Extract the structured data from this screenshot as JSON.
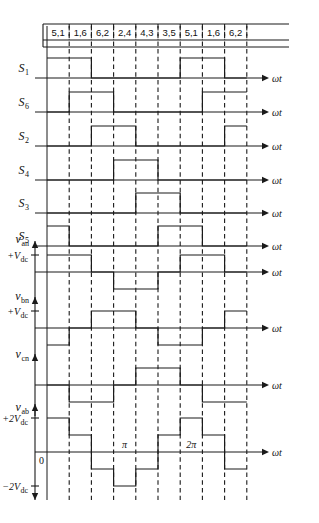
{
  "figure": {
    "axis_label": "ωt",
    "phase_marks": [
      {
        "label": "0",
        "x_col": 0
      },
      {
        "label": "π",
        "x_col": 3
      },
      {
        "label": "2π",
        "x_col": 6
      }
    ],
    "segment_headers": [
      "5,1",
      "1,6",
      "6,2",
      "2,4",
      "4,3",
      "3,5",
      "5,1",
      "1,6",
      "6,2"
    ],
    "segment_count": 9,
    "stroke_color": "#1a1a1a",
    "background_color": "#ffffff"
  },
  "chart_data": {
    "type": "line",
    "xlabel": "ωt",
    "ylabel": "",
    "grid": true,
    "legend": "none",
    "x_categories": [
      "5,1",
      "1,6",
      "6,2",
      "2,4",
      "4,3",
      "3,5",
      "5,1",
      "1,6",
      "6,2"
    ],
    "x_annotations": [
      {
        "label": "0",
        "segment_boundary": 0
      },
      {
        "label": "π",
        "segment_boundary": 3
      },
      {
        "label": "2π",
        "segment_boundary": 6
      }
    ],
    "note": "Each trace is a piecewise-constant waveform sampled over 9 equal 60-degree segments. Values are given per segment index 0..8.",
    "series": [
      {
        "name": "S1",
        "kind": "gate-signal",
        "label": "S",
        "subscript": "1",
        "levels": [
          1,
          1,
          0,
          0,
          0,
          0,
          1,
          1,
          0
        ],
        "ylim": [
          0,
          1
        ],
        "level_labels": []
      },
      {
        "name": "S6",
        "kind": "gate-signal",
        "label": "S",
        "subscript": "6",
        "levels": [
          0,
          1,
          1,
          0,
          0,
          0,
          0,
          1,
          1
        ],
        "ylim": [
          0,
          1
        ],
        "level_labels": []
      },
      {
        "name": "S2",
        "kind": "gate-signal",
        "label": "S",
        "subscript": "2",
        "levels": [
          0,
          0,
          1,
          1,
          0,
          0,
          0,
          0,
          1
        ],
        "ylim": [
          0,
          1
        ],
        "level_labels": []
      },
      {
        "name": "S4",
        "kind": "gate-signal",
        "label": "S",
        "subscript": "4",
        "levels": [
          0,
          0,
          0,
          1,
          1,
          0,
          0,
          0,
          0
        ],
        "ylim": [
          0,
          1
        ],
        "level_labels": []
      },
      {
        "name": "S3",
        "kind": "gate-signal",
        "label": "S",
        "subscript": "3",
        "levels": [
          0,
          0,
          0,
          0,
          1,
          1,
          0,
          0,
          0
        ],
        "ylim": [
          0,
          1
        ],
        "level_labels": []
      },
      {
        "name": "S5",
        "kind": "gate-signal",
        "label": "S",
        "subscript": "5",
        "levels": [
          1,
          0,
          0,
          0,
          0,
          1,
          1,
          0,
          0
        ],
        "ylim": [
          0,
          1
        ],
        "level_labels": []
      },
      {
        "name": "van",
        "kind": "phase-voltage",
        "label": "v",
        "subscript": "an",
        "levels": [
          1,
          1,
          0,
          -1,
          -1,
          0,
          1,
          1,
          0
        ],
        "ylim": [
          -1,
          1
        ],
        "level_labels": [
          {
            "text": "+V",
            "subscript": "dc",
            "value": 1
          }
        ]
      },
      {
        "name": "vbn",
        "kind": "phase-voltage",
        "label": "v",
        "subscript": "bn",
        "levels": [
          -1,
          0,
          1,
          1,
          0,
          -1,
          -1,
          0,
          1
        ],
        "ylim": [
          -1,
          1
        ],
        "level_labels": [
          {
            "text": "+V",
            "subscript": "dc",
            "value": 1
          }
        ]
      },
      {
        "name": "vcn",
        "kind": "phase-voltage",
        "label": "v",
        "subscript": "cn",
        "levels": [
          0,
          -1,
          -1,
          0,
          1,
          1,
          0,
          -1,
          -1
        ],
        "ylim": [
          -1,
          1
        ],
        "level_labels": []
      },
      {
        "name": "vab",
        "kind": "line-voltage",
        "label": "v",
        "subscript": "ab",
        "levels": [
          2,
          1,
          -1,
          -2,
          -1,
          1,
          2,
          1,
          -1
        ],
        "ylim": [
          -2,
          2
        ],
        "level_labels": [
          {
            "text": "+2V",
            "subscript": "dc",
            "value": 2
          },
          {
            "text": "−2V",
            "subscript": "dc",
            "value": -2
          },
          {
            "text": "0",
            "subscript": "",
            "value": 0
          }
        ]
      }
    ]
  }
}
